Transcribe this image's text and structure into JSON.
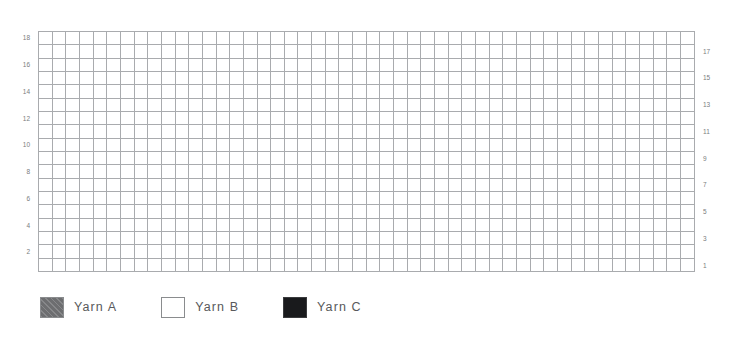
{
  "chart_data": {
    "type": "heatmap",
    "title": "",
    "subtitle": "",
    "xlabel": "",
    "ylabel": "",
    "grid": true,
    "legend_position": "bottom-left",
    "columns": 48,
    "rows": 18,
    "row_numbering": {
      "left_side_labels": [
        "18",
        "16",
        "14",
        "12",
        "10",
        "8",
        "6",
        "4",
        "2"
      ],
      "right_side_labels": [
        "17",
        "15",
        "13",
        "11",
        "9",
        "7",
        "5",
        "3",
        "1"
      ],
      "left_rows": [
        18,
        16,
        14,
        12,
        10,
        8,
        6,
        4,
        2
      ],
      "right_rows": [
        17,
        15,
        13,
        11,
        9,
        7,
        5,
        3,
        1
      ],
      "direction": "bottom-to-top"
    },
    "palette": {
      "A": "#6d6e70",
      "B": "#ffffff",
      "C": "#3a3b3d"
    },
    "legend": [
      {
        "key": "A",
        "label": "Yarn A",
        "swatch": "hatched-gray"
      },
      {
        "key": "B",
        "label": "Yarn B",
        "swatch": "white"
      },
      {
        "key": "C",
        "label": "Yarn C",
        "swatch": "black"
      }
    ],
    "cell_codes": {
      "A": "Yarn A",
      "B": "Yarn B",
      "C": "Yarn C"
    },
    "rows_top_to_bottom": [
      "BBBBBBBBBBBBBBBBBBBBBCCCCCCCBBBBBBBBBBBBBBBBBBBB",
      "BBBBBBBBBBBBBBBBBBBBBCCCCCCCBBBBBBBBBBBBBBBBBBBB",
      "AAAAAAAAAAAAAAAAAAAAACCCCCCCAAAAAAAAAAAAAAAAAAAA",
      "AAAAAAAAAAAAAAAAAAAABCCCCCBAAAAAAAAAAAAAAAAAAAAA",
      "AAAAAAAAAAAAAABBBBBBBBCCCBBBBAAAAAAAABBBBBBAAAAA",
      "AAAAAAAAAAAABBBBBAAAABBBBBBBBBBAAAAABBBBBBBBAAAA",
      "AAAAAAAAAABBBBBBBAABBBBBBBBBBBBBBAAABBBBBBBBBAAA",
      "AAAAAAAABBBBBBBBBBBBBBBBBBBBBBBBBBBBBBBBBBBBAAA",
      "AAAAAABBBBBBBBBBBBBBBBBBBBBBBBBBBBBBBBBBBBBBBAA",
      "AAAABBBBBBBBBBBBBBBBBBBBBBBBBBBBBBBBBBBBBBBBBAA",
      "AAAABBBBBBBBBBBBBBBBBBBBBBBBBBBBBBBBBBBBBBBBBAA",
      "AABBBBBBBBBBBBBBBBBBBBBBBBBBBBBBBBBBBBBBBBBBBAA",
      "AABBBBBBBBBBBBBBBBBBBBBBBBBBBBBBBBBBBBBBBBBBBBA",
      "ABBBBBBBBBBBBBBBBBBBBBBBBBBBBBBBBBBBBBBBBBBBBBA",
      "ABBBBBBBBBBBBBBBBBBBBBBBBBBBBBBBBBBBBBBBBBBBBBA",
      "ABBBBBBBBBBBBBBBBBBBBBBBBBBBBBBBBBBBBBBBBBBBBBA",
      "ABBBBBBBBBBBBBBBBBBBBBBBBBBBBBBBBBBBBBBBBBBBBBA",
      "ABBBBBBBBBBBBBBBBBBBBBBBBBBBBBBBBBBBBBBBBBBBBBA"
    ]
  }
}
